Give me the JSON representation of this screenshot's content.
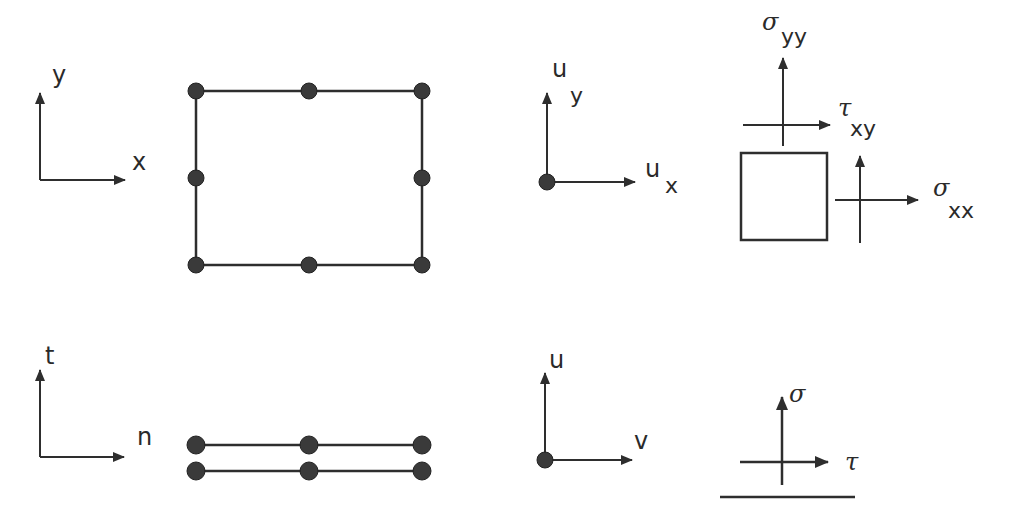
{
  "diagram": {
    "panels": {
      "continuum_element": {
        "axes": {
          "horizontal": "x",
          "vertical": "y"
        },
        "element": "8-node quadrilateral element",
        "nodes": 8
      },
      "continuum_dof": {
        "dof_symbol": "u",
        "horizontal_subscript": "x",
        "vertical_subscript": "y"
      },
      "continuum_stress": {
        "normal_x_symbol": "σ",
        "normal_x_subscript": "xx",
        "normal_y_symbol": "σ",
        "normal_y_subscript": "yy",
        "shear_symbol": "τ",
        "shear_subscript": "xy"
      },
      "interface_element": {
        "axes": {
          "horizontal": "n",
          "vertical": "t"
        },
        "element": "6-node interface element",
        "nodes": 6
      },
      "interface_dof": {
        "horizontal": "v",
        "vertical": "u"
      },
      "interface_stress": {
        "normal": "σ",
        "shear": "τ"
      }
    }
  }
}
